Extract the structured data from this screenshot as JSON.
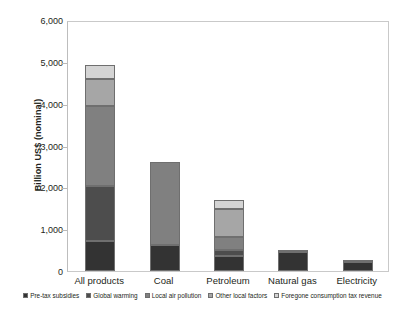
{
  "chart_data": {
    "type": "bar",
    "title": "",
    "subtype": "stacked-bar",
    "xlabel": "",
    "ylabel": "Billion US$  (nominal)",
    "ylim": [
      0,
      6000
    ],
    "ytick_labels": [
      "6,000",
      "5,000",
      "4,000",
      "3,000",
      "2,000",
      "1,000",
      "0"
    ],
    "ytick_values": [
      6000,
      5000,
      4000,
      3000,
      2000,
      1000,
      0
    ],
    "grid": false,
    "legend_position": "bottom",
    "categories": [
      "All products",
      "Coal",
      "Petroleum",
      "Natural gas",
      "Electricity"
    ],
    "series": [
      {
        "name": "Pre-tax subsidies",
        "color": "#333333",
        "values": [
          710,
          622,
          366,
          455,
          215
        ]
      },
      {
        "name": "Global warming",
        "color": "#4d4d4d",
        "values": [
          1330,
          0,
          136,
          0,
          0
        ]
      },
      {
        "name": "Local air pollution",
        "color": "#808080",
        "values": [
          1912,
          1992,
          318,
          0,
          0
        ]
      },
      {
        "name": "Other local factors",
        "color": "#a6a6a6",
        "values": [
          638,
          0,
          662,
          47,
          48
        ]
      },
      {
        "name": "Foregone consumption tax revenue",
        "color": "#d4d4d4",
        "values": [
          345,
          0,
          215,
          0,
          0
        ]
      }
    ],
    "totals": [
      4935,
      2614,
      1697,
      502,
      263
    ]
  },
  "axis": {
    "y_title": "Billion US$  (nominal)"
  },
  "legend": {
    "items": [
      {
        "label": "Pre-tax subsidies",
        "color": "#333333"
      },
      {
        "label": "Global warming",
        "color": "#4d4d4d"
      },
      {
        "label": "Local air pollution",
        "color": "#808080"
      },
      {
        "label": "Other local factors",
        "color": "#a6a6a6"
      },
      {
        "label": "Foregone consumption tax revenue",
        "color": "#d4d4d4"
      }
    ]
  }
}
